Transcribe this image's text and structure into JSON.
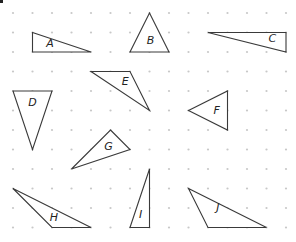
{
  "grid": {
    "origin_x": 13,
    "origin_y": 13,
    "spacing": 19.5,
    "cols": 15,
    "rows": 12,
    "dot_color": "#c8c8c8"
  },
  "stroke_color": "#3a3a3a",
  "triangles": [
    {
      "label": "A",
      "points": [
        [
          1,
          1
        ],
        [
          1,
          2
        ],
        [
          4,
          2
        ]
      ],
      "label_pos": [
        1.9,
        1.6
      ]
    },
    {
      "label": "B",
      "points": [
        [
          7,
          0
        ],
        [
          6,
          2
        ],
        [
          8,
          2
        ]
      ],
      "label_pos": [
        7.05,
        1.45
      ]
    },
    {
      "label": "C",
      "points": [
        [
          10,
          1
        ],
        [
          14,
          1
        ],
        [
          14,
          2
        ]
      ],
      "label_pos": [
        13.3,
        1.35
      ]
    },
    {
      "label": "D",
      "points": [
        [
          0,
          4
        ],
        [
          2,
          4
        ],
        [
          1,
          7
        ]
      ],
      "label_pos": [
        1.0,
        4.6
      ]
    },
    {
      "label": "E",
      "points": [
        [
          4,
          3
        ],
        [
          6,
          3
        ],
        [
          7,
          5
        ]
      ],
      "label_pos": [
        5.75,
        3.55
      ]
    },
    {
      "label": "F",
      "points": [
        [
          9,
          5
        ],
        [
          11,
          4
        ],
        [
          11,
          6
        ]
      ],
      "label_pos": [
        10.45,
        5.05
      ]
    },
    {
      "label": "G",
      "points": [
        [
          5,
          6
        ],
        [
          6,
          7
        ],
        [
          3,
          8
        ]
      ],
      "label_pos": [
        4.9,
        6.85
      ]
    },
    {
      "label": "H",
      "points": [
        [
          0,
          9
        ],
        [
          2,
          11
        ],
        [
          4,
          11
        ]
      ],
      "label_pos": [
        2.1,
        10.5
      ]
    },
    {
      "label": "I",
      "points": [
        [
          7,
          8
        ],
        [
          6,
          11
        ],
        [
          7,
          11
        ]
      ],
      "label_pos": [
        6.55,
        10.35
      ]
    },
    {
      "label": "J",
      "points": [
        [
          9,
          9
        ],
        [
          10,
          11
        ],
        [
          13,
          11
        ]
      ],
      "label_pos": [
        10.5,
        10.0
      ]
    }
  ]
}
